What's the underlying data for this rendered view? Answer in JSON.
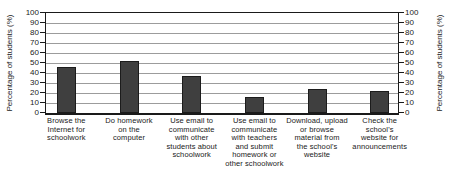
{
  "chart_data": {
    "type": "bar",
    "title": "",
    "ylabel_left": "Percentage of students (%)",
    "ylabel_right": "Percentage of students (%)",
    "categories": [
      "Browse the\nInternet for\nschoolwork",
      "Do homework\non the\ncomputer",
      "Use email to\ncommunicate\nwith other\nstudents about\nschoolwork",
      "Use email to\ncommunicate\nwith teachers\nand submit\nhomework or\nother schoolwork",
      "Download, upload\nor browse\nmaterial from\nthe school's\nwebsite",
      "Check the\nschool's\nwebsite for\nannouncements"
    ],
    "values": [
      46,
      52,
      37,
      16,
      24,
      22
    ],
    "ylim": [
      0,
      100
    ],
    "yticks": [
      0,
      10,
      20,
      30,
      40,
      50,
      60,
      70,
      80,
      90,
      100
    ],
    "grid": "horizontal",
    "legend": "none"
  },
  "colors": {
    "bar": "#3f3f3f",
    "bar_border": "#1c1c1c",
    "grid": "#9c9c9c",
    "axis": "#1a1a1a",
    "text": "#1a1a1a",
    "background": "#ffffff"
  }
}
